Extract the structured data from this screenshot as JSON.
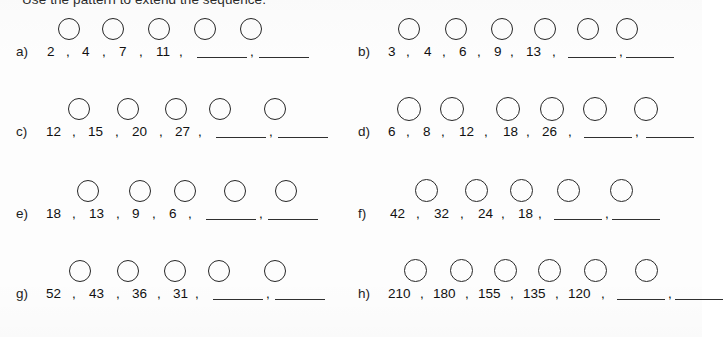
{
  "worksheet": {
    "instruction": "Use the pattern to extend the sequence.",
    "blank_placeholder": "",
    "comma": ",",
    "ink_color": "#1c1c1c",
    "circle_stroke_color": "#262626",
    "paper_color": "#fdfdfd"
  },
  "problems": [
    {
      "label": "a)",
      "column": "left",
      "row": 1,
      "terms": [
        "2",
        "4",
        "7",
        "11"
      ],
      "blanks": 2,
      "circle_count": 5,
      "circle_size": 22,
      "circle_positions": [
        42,
        86,
        132,
        178,
        224
      ],
      "circle_top": 2,
      "term_positions": [
        31,
        66,
        103,
        140
      ],
      "comma_positions": [
        50,
        86,
        123,
        163
      ],
      "blank_positions": [
        181,
        243
      ],
      "blank_width": 50,
      "label_left": 0
    },
    {
      "label": "b)",
      "column": "right",
      "row": 1,
      "terms": [
        "3",
        "4",
        "6",
        "9",
        "13"
      ],
      "blanks": 2,
      "circle_count": 6,
      "circle_size": 22,
      "circle_positions": [
        40,
        87,
        133,
        176,
        219,
        258
      ],
      "circle_top": 2,
      "term_positions": [
        30,
        66,
        101,
        136,
        168
      ],
      "comma_positions": [
        48,
        84,
        119,
        152,
        194
      ],
      "blank_positions": [
        210,
        268
      ],
      "blank_width": 48,
      "label_left": 0
    },
    {
      "label": "c)",
      "column": "left",
      "row": 2,
      "terms": [
        "12",
        "15",
        "20",
        "27"
      ],
      "blanks": 2,
      "circle_count": 5,
      "circle_size": 22,
      "circle_positions": [
        52,
        101,
        149,
        193,
        248
      ],
      "circle_top": 2,
      "term_positions": [
        30,
        72,
        116,
        159
      ],
      "comma_positions": [
        56,
        99,
        143,
        182
      ],
      "blank_positions": [
        200,
        262
      ],
      "blank_width": 50,
      "label_left": 0
    },
    {
      "label": "d)",
      "column": "right",
      "row": 2,
      "terms": [
        "6",
        "8",
        "12",
        "18",
        "26"
      ],
      "blanks": 2,
      "circle_count": 6,
      "circle_size": 24,
      "circle_positions": [
        39,
        82,
        138,
        182,
        225,
        276
      ],
      "circle_top": 1,
      "term_positions": [
        30,
        65,
        101,
        145,
        184
      ],
      "comma_positions": [
        48,
        83,
        126,
        168,
        210
      ],
      "blank_positions": [
        226,
        288
      ],
      "blank_width": 48,
      "label_left": 0
    },
    {
      "label": "e)",
      "column": "left",
      "row": 3,
      "terms": [
        "18",
        "13",
        "9",
        "6"
      ],
      "blanks": 2,
      "circle_count": 5,
      "circle_size": 22,
      "circle_positions": [
        61,
        113,
        158,
        208,
        259
      ],
      "circle_top": 2,
      "term_positions": [
        30,
        73,
        116,
        153
      ],
      "comma_positions": [
        56,
        100,
        136,
        172
      ],
      "blank_positions": [
        190,
        252
      ],
      "blank_width": 50,
      "label_left": 0
    },
    {
      "label": "f)",
      "column": "right",
      "row": 3,
      "terms": [
        "42",
        "32",
        "24",
        "18"
      ],
      "blanks": 2,
      "circle_count": 5,
      "circle_size": 23,
      "circle_positions": [
        57,
        107,
        152,
        199,
        252
      ],
      "circle_top": 1,
      "term_positions": [
        32,
        76,
        120,
        160
      ],
      "comma_positions": [
        58,
        102,
        143,
        180
      ],
      "blank_positions": [
        196,
        254
      ],
      "blank_width": 48,
      "label_left": 0
    },
    {
      "label": "g)",
      "column": "left",
      "row": 4,
      "terms": [
        "52",
        "43",
        "36",
        "31"
      ],
      "blanks": 2,
      "circle_count": 5,
      "circle_size": 22,
      "circle_positions": [
        53,
        101,
        148,
        192,
        248
      ],
      "circle_top": 2,
      "term_positions": [
        30,
        73,
        116,
        157
      ],
      "comma_positions": [
        56,
        100,
        141,
        179
      ],
      "blank_positions": [
        197,
        259
      ],
      "blank_width": 50,
      "label_left": 0
    },
    {
      "label": "h)",
      "column": "right",
      "row": 4,
      "terms": [
        "210",
        "180",
        "155",
        "135",
        "120"
      ],
      "blanks": 2,
      "circle_count": 6,
      "circle_size": 23,
      "circle_positions": [
        46,
        92,
        136,
        180,
        226,
        277
      ],
      "circle_top": 1,
      "term_positions": [
        30,
        75,
        120,
        165,
        210
      ],
      "comma_positions": [
        62,
        107,
        152,
        197,
        243
      ],
      "blank_positions": [
        259,
        317
      ],
      "blank_width": 48,
      "label_left": 0
    }
  ]
}
